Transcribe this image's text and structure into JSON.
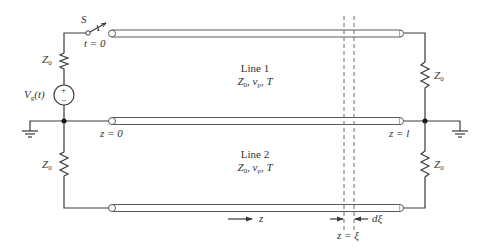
{
  "diagram": {
    "switch": {
      "label": "S",
      "time": "t = 0"
    },
    "source": {
      "label": "V",
      "sub": "g",
      "arg": "(t)",
      "plus": "+",
      "minus": "−"
    },
    "resistors": {
      "top_left": {
        "label": "Z",
        "sub": "0"
      },
      "bottom_left": {
        "label": "Z",
        "sub": "0"
      },
      "top_right": {
        "label": "Z",
        "sub": "0"
      },
      "bottom_right": {
        "label": "Z",
        "sub": "0"
      }
    },
    "line1": {
      "title": "Line 1",
      "params_Z": "Z",
      "params_Zsub": "0",
      "params_v": ", v",
      "params_vsub": "p",
      "params_T": ", T"
    },
    "line2": {
      "title": "Line 2",
      "params_Z": "Z",
      "params_Zsub": "0",
      "params_v": ", v",
      "params_vsub": "p",
      "params_T": ", T"
    },
    "positions": {
      "start": "z = 0",
      "end": "z = l",
      "direction": "z",
      "xi": "z = ξ",
      "dxi": "dξ"
    },
    "colors": {
      "wire": "#3a3a3a",
      "text": "#333333",
      "background": "#ffffff"
    }
  }
}
